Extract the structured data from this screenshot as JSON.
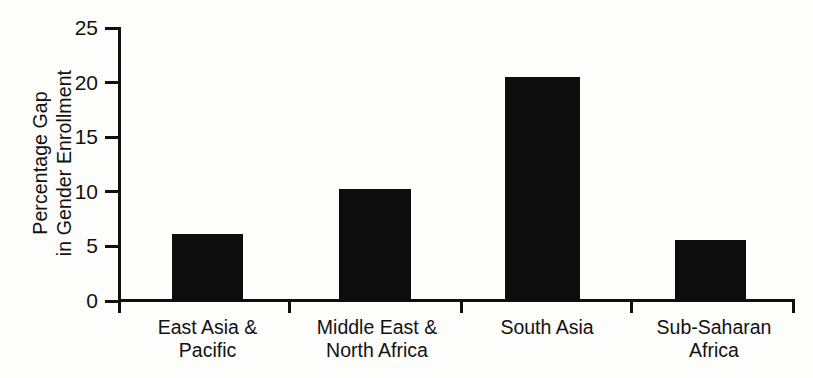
{
  "chart_data": {
    "type": "bar",
    "title": "",
    "xlabel": "",
    "ylabel_lines": [
      "Percentage Gap",
      "in Gender Enrollment"
    ],
    "ylabel": "Percentage Gap in Gender Enrollment",
    "categories": [
      "East Asia & Pacific",
      "Middle East & North Africa",
      "South Asia",
      "Sub-Saharan Africa"
    ],
    "category_lines": [
      [
        "East Asia &",
        "Pacific"
      ],
      [
        "Middle East &",
        "North Africa"
      ],
      [
        "South Asia",
        ""
      ],
      [
        "Sub-Saharan",
        "Africa"
      ]
    ],
    "values": [
      6.1,
      10.3,
      20.5,
      5.6
    ],
    "ylim": [
      0,
      25
    ],
    "yticks": [
      0,
      5,
      10,
      15,
      20,
      25
    ],
    "ytick_labels": [
      "0",
      "5",
      "10",
      "15",
      "20",
      "25"
    ],
    "grid": false,
    "legend": null,
    "bar_color": "#0d0d0d",
    "axis_color": "#101010",
    "background_color": "#fdfdfc"
  }
}
